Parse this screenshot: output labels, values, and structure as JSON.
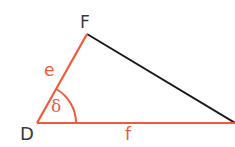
{
  "diagram": {
    "type": "triangle",
    "vertices": {
      "D": {
        "label": "D"
      },
      "F": {
        "label": "F"
      }
    },
    "sides": {
      "e": {
        "label": "e",
        "between": "D-F",
        "color": "#f05a3a"
      },
      "f": {
        "label": "f",
        "between": "D-right vertex",
        "color": "#f05a3a"
      },
      "third": {
        "between": "F-right vertex",
        "color": "#1a1a1a"
      }
    },
    "angle": {
      "label": "δ",
      "at": "D",
      "color": "#f05a3a"
    }
  }
}
